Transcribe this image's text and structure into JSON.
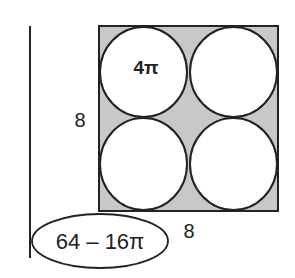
{
  "diagram": {
    "title": "",
    "square": {
      "side_label_left": "8",
      "side_label_bottom": "8",
      "fill": "#c8c8c8",
      "stroke": "#222222"
    },
    "circles": [
      {
        "id": "top-left",
        "label": "4π"
      },
      {
        "id": "top-right",
        "label": ""
      },
      {
        "id": "bottom-left",
        "label": ""
      },
      {
        "id": "bottom-right",
        "label": ""
      }
    ],
    "answer": {
      "text": "64 – 16π"
    }
  }
}
